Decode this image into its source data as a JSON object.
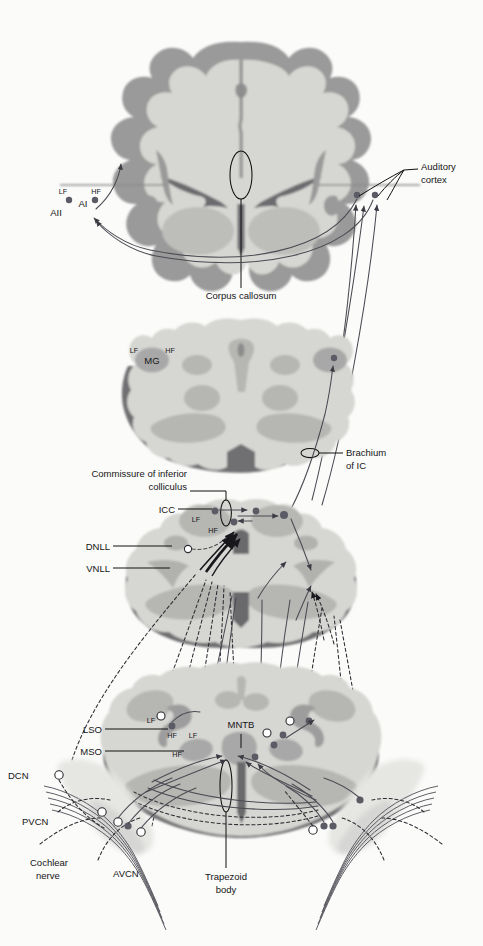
{
  "figure": {
    "background_color": "#fbfbfa"
  },
  "palette": {
    "cortex_ribbon": "#9a9a9a",
    "white_matter": "#d6d6d2",
    "nucleus_gray": "#a8a8a8",
    "section_shadow": "#6f6f72",
    "mid_gray": "#b9b9b6",
    "light_gray": "#e2e2df",
    "axon_solid": "#4a4a52",
    "axon_dashed": "#2c2c33",
    "label_text": "#151515"
  },
  "sections": [
    {
      "id": "cerebrum",
      "name": "Coronal section through cerebrum / auditory cortex"
    },
    {
      "id": "thalamus",
      "name": "Section through thalamus / medial geniculate"
    },
    {
      "id": "midbrain",
      "name": "Section through midbrain / inferior colliculus"
    },
    {
      "id": "pons",
      "name": "Section through pons / superior olivary complex"
    }
  ],
  "labels": {
    "auditory_cortex": "Auditory\ncortex",
    "auditory_cortex_line1": "Auditory",
    "auditory_cortex_line2": "cortex",
    "corpus_callosum": "Corpus callosum",
    "brachium_of_ic_line1": "Brachium",
    "brachium_of_ic_line2": "of IC",
    "commissure_line1": "Commissure of inferior",
    "commissure_line2": "colliculus",
    "cochlear_nerve_line1": "Cochlear",
    "cochlear_nerve_line2": "nerve",
    "trapezoid_body_line1": "Trapezoid",
    "trapezoid_body_line2": "body",
    "ai": "AI",
    "aii": "AII",
    "mg": "MG",
    "icc": "ICC",
    "dnll": "DNLL",
    "vnll": "VNLL",
    "lso": "LSO",
    "mso": "MSO",
    "mntb": "MNTB",
    "dcn": "DCN",
    "pvcn": "PVCN",
    "avcn": "AVCN",
    "lf": "LF",
    "hf": "HF"
  },
  "tonotopy_markers": [
    {
      "region": "AI",
      "lf": "LF",
      "hf": "HF"
    },
    {
      "region": "MG",
      "lf": "LF",
      "hf": "HF"
    },
    {
      "region": "ICC",
      "lf": "LF",
      "hf": "HF"
    },
    {
      "region": "LSO",
      "lf": "LF",
      "hf": "HF"
    },
    {
      "region": "MSO",
      "lf": "LF",
      "hf": "HF"
    }
  ],
  "structures": [
    {
      "abbr": "AI",
      "level": "cerebrum",
      "side": "left"
    },
    {
      "abbr": "AII",
      "level": "cerebrum",
      "side": "left"
    },
    {
      "abbr": "MG",
      "level": "thalamus",
      "side": "left"
    },
    {
      "abbr": "ICC",
      "level": "midbrain",
      "side": "left"
    },
    {
      "abbr": "DNLL",
      "level": "midbrain",
      "side": "left"
    },
    {
      "abbr": "VNLL",
      "level": "midbrain",
      "side": "left"
    },
    {
      "abbr": "LSO",
      "level": "pons",
      "side": "left"
    },
    {
      "abbr": "MSO",
      "level": "pons",
      "side": "left"
    },
    {
      "abbr": "MNTB",
      "level": "pons",
      "side": "left"
    },
    {
      "abbr": "DCN",
      "level": "pons",
      "side": "left"
    },
    {
      "abbr": "PVCN",
      "level": "pons",
      "side": "left"
    },
    {
      "abbr": "AVCN",
      "level": "pons",
      "side": "left"
    }
  ],
  "commissural_tracts": [
    {
      "abbr": "Corpus callosum",
      "level": "cerebrum"
    },
    {
      "abbr": "Commissure of inferior colliculus",
      "level": "midbrain"
    },
    {
      "abbr": "Trapezoid body",
      "level": "pons"
    },
    {
      "abbr": "Brachium of IC",
      "level": "thalamus"
    }
  ]
}
